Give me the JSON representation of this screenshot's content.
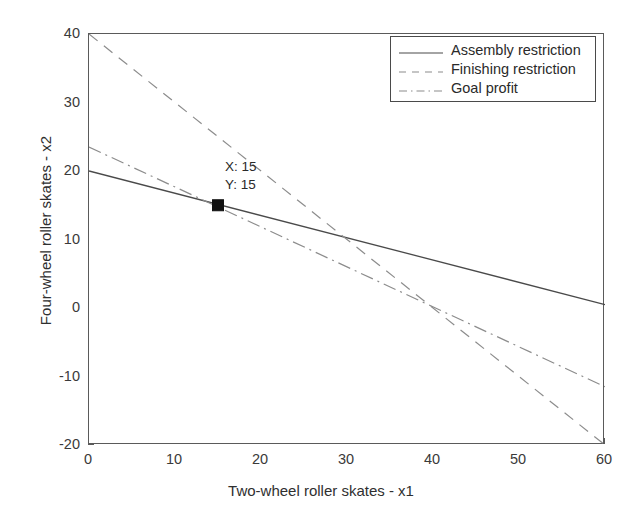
{
  "chart_data": {
    "type": "line",
    "title": "",
    "subtitle": "",
    "xlabel": "Two-wheel roller skates - x1",
    "ylabel": "Four-wheel roller skates - x2",
    "xlim": [
      0,
      60
    ],
    "ylim": [
      -20,
      40
    ],
    "xticks": [
      0,
      10,
      20,
      30,
      40,
      50,
      60
    ],
    "yticks": [
      40,
      30,
      20,
      10,
      0,
      -10,
      -20
    ],
    "xtick_labels": [
      "0",
      "10",
      "20",
      "30",
      "40",
      "50",
      "60"
    ],
    "ytick_labels": [
      "40",
      "30",
      "20",
      "10",
      "0",
      "-10",
      "-20"
    ],
    "grid": false,
    "legend_position": "top-right",
    "series": [
      {
        "name": "Assembly restriction",
        "style": "solid",
        "color": "#4a4a4a",
        "x": [
          0,
          60
        ],
        "values": [
          20,
          0.5
        ]
      },
      {
        "name": "Finishing restriction",
        "style": "dashed",
        "color": "#8c8c8c",
        "x": [
          0,
          60
        ],
        "values": [
          40,
          -20
        ]
      },
      {
        "name": "Goal profit",
        "style": "dash-dot",
        "color": "#8c8c8c",
        "x": [
          0,
          60
        ],
        "values": [
          23.5,
          -11.5
        ]
      }
    ],
    "annotations": [
      {
        "name": "optimal-point",
        "marker": "filled-square",
        "marker_color": "#111111",
        "x": 15,
        "y": 15,
        "label_x": "X: 15",
        "label_y": "Y: 15"
      }
    ]
  },
  "legend": {
    "entries": [
      {
        "label": "Assembly restriction",
        "style": "solid"
      },
      {
        "label": "Finishing restriction",
        "style": "dashed"
      },
      {
        "label": "Goal profit",
        "style": "dash-dot"
      }
    ]
  },
  "axes": {
    "x_title": "Two-wheel roller skates - x1",
    "y_title": "Four-wheel roller skates - x2"
  },
  "datatip": {
    "x_text": "X: 15",
    "y_text": "Y: 15"
  },
  "colors": {
    "axis": "#5a5a5a",
    "solid_line": "#4a4a4a",
    "dashed_line": "#8c8c8c",
    "dashdot_line": "#8c8c8c",
    "marker": "#111111",
    "background": "#ffffff"
  }
}
